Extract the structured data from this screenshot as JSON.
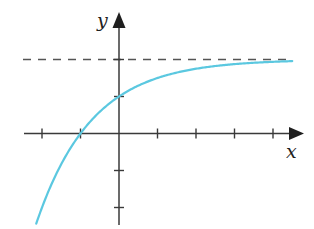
{
  "chart_data": {
    "type": "line",
    "title": "",
    "xlabel": "x",
    "ylabel": "y",
    "function": "y = 2 - 2^(-x)",
    "asymptote": {
      "y": 2,
      "style": "dashed",
      "label": ""
    },
    "x_ticks": [
      -2,
      -1,
      0,
      1,
      2,
      3,
      4
    ],
    "y_ticks": [
      -2,
      -1,
      0,
      1,
      2
    ],
    "tick_labels_shown": false,
    "xlim": [
      -2.2,
      4.6
    ],
    "ylim": [
      -2.5,
      2.7
    ],
    "grid": false,
    "legend": null,
    "series": [
      {
        "name": "curve",
        "color": "#5bc8e0",
        "x": [
          -2.15,
          -2,
          -1.5,
          -1,
          -0.5,
          0,
          0.5,
          1,
          1.5,
          2,
          2.5,
          3,
          3.5,
          4,
          4.5
        ],
        "y": [
          -2.44,
          -2,
          -0.83,
          0,
          0.59,
          1,
          1.29,
          1.5,
          1.65,
          1.75,
          1.82,
          1.875,
          1.91,
          1.94,
          1.96
        ]
      }
    ],
    "key_points": [
      {
        "x": -1,
        "y": 0,
        "note": "x-intercept"
      },
      {
        "x": 0,
        "y": 1,
        "note": "y-intercept"
      }
    ]
  },
  "colors": {
    "axis": "#3a3a3a",
    "curve": "#5bc8e0",
    "asymptote": "#555555"
  }
}
